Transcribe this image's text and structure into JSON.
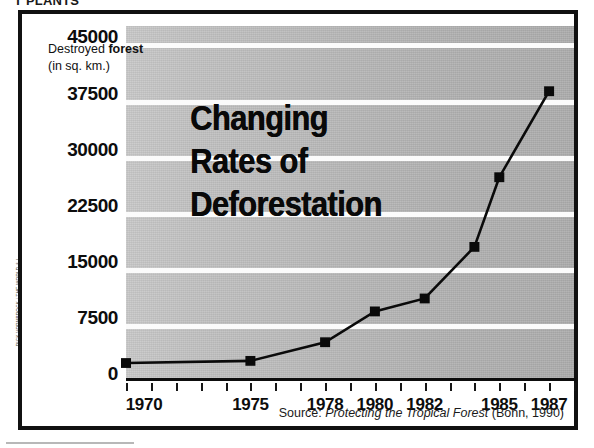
{
  "page": {
    "clipped_header": "T PLANTS",
    "credit": "RICK VORNBROCK / THE WORLD & I"
  },
  "title": {
    "line1": "Changing",
    "line2": "Rates of",
    "line3": "Deforestation"
  },
  "axis_caption": {
    "line1_prefix": "Destroyed ",
    "line1_bold": "forest",
    "line2": "(in sq. km.)"
  },
  "source": {
    "prefix": "Source: ",
    "title": "Protecting the Tropical Forest",
    "suffix": " (Bonn, 1990)"
  },
  "chart_data": {
    "type": "line",
    "title": "Changing Rates of Deforestation",
    "xlabel": "",
    "ylabel": "Destroyed forest (in sq. km.)",
    "ylim": [
      0,
      45000
    ],
    "xlim": [
      1970,
      1988
    ],
    "grid": true,
    "legend": false,
    "y_ticks": [
      0,
      7500,
      15000,
      22500,
      30000,
      37500,
      45000
    ],
    "y_tick_labels": [
      "0",
      "7500",
      "15000",
      "22500",
      "30000",
      "37500",
      "45000"
    ],
    "x_tick_labels": [
      "1970",
      "1975",
      "1978",
      "1980",
      "1982",
      "1985",
      "1987"
    ],
    "x_tick_years": [
      1970,
      1971,
      1972,
      1973,
      1974,
      1975,
      1976,
      1977,
      1978,
      1979,
      1980,
      1981,
      1982,
      1983,
      1984,
      1985,
      1986,
      1987,
      1988
    ],
    "marker": "square",
    "series": [
      {
        "name": "Destroyed forest",
        "x": [
          1970,
          1975,
          1978,
          1980,
          1982,
          1984,
          1985,
          1987
        ],
        "values": [
          300,
          600,
          3200,
          7500,
          9300,
          16500,
          26200,
          38200
        ]
      }
    ]
  }
}
